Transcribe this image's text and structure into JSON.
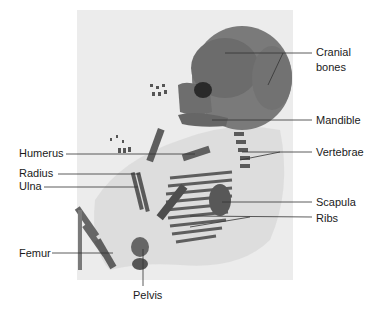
{
  "figure": {
    "photo_background": "#ececec",
    "bone_color": "#6a6a6a",
    "leader_line_color": "#333333",
    "labels": {
      "cranial_line1": "Cranial",
      "cranial_line2": "bones",
      "mandible": "Mandible",
      "humerus": "Humerus",
      "vertebrae": "Vertebrae",
      "radius": "Radius",
      "ulna": "Ulna",
      "scapula": "Scapula",
      "ribs": "Ribs",
      "femur": "Femur",
      "pelvis": "Pelvis"
    }
  }
}
